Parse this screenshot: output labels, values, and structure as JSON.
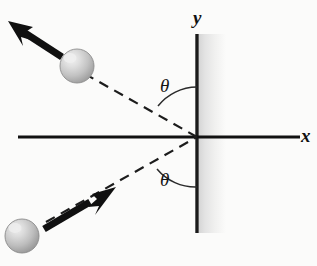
{
  "figure": {
    "background_color": "#fbfbfa",
    "line_color": "#111111",
    "wall_color": "#1a1a1a",
    "sphere_color": "#cfcfcf"
  },
  "axes": {
    "x_label": "x",
    "y_label": "y",
    "x_axis": {
      "x1": 18,
      "y1": 137,
      "x2": 300,
      "y2": 137
    },
    "origin": {
      "x": 197,
      "y": 137
    }
  },
  "wall": {
    "name": "vertical-wall",
    "x": 197,
    "y_top": 34,
    "y_bottom": 233,
    "thickness": 3,
    "shadow_width": 27
  },
  "angles": {
    "upper_label": "θ",
    "lower_label": "θ",
    "upper_value_deg": 40,
    "lower_value_deg": 40
  },
  "incoming": {
    "name": "incoming-ball-path",
    "ball": {
      "cx": 22,
      "cy": 236,
      "r": 17
    },
    "dashed_from": {
      "x": 52,
      "y": 219
    },
    "dashed_to": {
      "x": 197,
      "y": 137
    },
    "arrow_from": {
      "x": 44,
      "y": 228
    },
    "arrow_to": {
      "x": 113,
      "y": 189
    },
    "direction": "up-right"
  },
  "outgoing": {
    "name": "outgoing-ball-path",
    "ball": {
      "cx": 77,
      "cy": 66,
      "r": 17
    },
    "dashed_from": {
      "x": 197,
      "y": 137
    },
    "dashed_to": {
      "x": 94,
      "y": 79
    },
    "arrow_from": {
      "x": 62,
      "y": 56
    },
    "arrow_to": {
      "x": 10,
      "y": 22
    },
    "direction": "up-left"
  }
}
